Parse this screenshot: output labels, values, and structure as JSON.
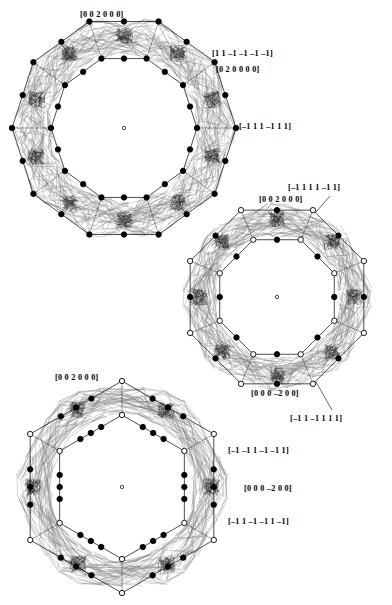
{
  "figure": {
    "type": "polytope-projection-diagram",
    "background_color": "#ffffff",
    "ink_color": "#000000",
    "panel_count": 3
  },
  "panels": [
    {
      "id": "panel-decagon",
      "shape": "decagon",
      "sides": 10,
      "center": [
        124,
        128
      ],
      "outer_radius": 112,
      "inner_radius": 73,
      "outer_marker": "filled",
      "inner_marker": "filled",
      "has_center_dot": true,
      "rotation_deg": 18,
      "labels": [
        {
          "name": "label-decagon-top",
          "text": "[0 0 2 0 0 0]",
          "x": 80,
          "y": 11,
          "anchor_vertex": [
            124,
            16
          ],
          "leader": false
        },
        {
          "name": "label-decagon-upper-right",
          "text": "[1 1 –1 –1 –1 –1]",
          "x": 212,
          "y": 50,
          "anchor_vertex": [
            213,
            66
          ],
          "leader": false
        },
        {
          "name": "label-decagon-right-upper",
          "text": "[0 2 0 0 0 0]",
          "x": 216,
          "y": 66,
          "anchor_vertex": [
            213,
            70
          ],
          "leader": false
        },
        {
          "name": "label-decagon-right",
          "text": "[–1 1 1 –1 1 1]",
          "x": 239,
          "y": 123,
          "anchor_vertex": [
            234,
            128
          ],
          "leader": false
        }
      ]
    },
    {
      "id": "panel-octagon",
      "shape": "octagon",
      "sides": 8,
      "center": [
        277,
        297
      ],
      "outer_radius": 94,
      "inner_radius": 62,
      "outer_marker": "mixed",
      "inner_marker": "mixed",
      "has_center_dot": true,
      "rotation_deg": 22.5,
      "labels": [
        {
          "name": "label-octagon-upper-right",
          "text": "[–1 1 1 1 –1 1]",
          "x": 288,
          "y": 184,
          "anchor_vertex": [
            312,
            214
          ],
          "leader": true,
          "leader_path": "M 330 196 L 316 212"
        },
        {
          "name": "label-octagon-top",
          "text": "[0 0 2 0 0 0]",
          "x": 259,
          "y": 196,
          "anchor_vertex": [
            277,
            209
          ],
          "leader": false
        },
        {
          "name": "label-octagon-bottom",
          "text": "[0 0 0 –2 0 0]",
          "x": 251,
          "y": 390,
          "anchor_vertex": [
            277,
            385
          ],
          "leader": false
        },
        {
          "name": "label-octagon-bottom-right",
          "text": "[–1 1 –1 1 1 1]",
          "x": 290,
          "y": 415,
          "anchor_vertex": [
            312,
            380
          ],
          "leader": true,
          "leader_path": "M 316 382 L 332 410"
        }
      ]
    },
    {
      "id": "panel-hexagon",
      "shape": "hexagon",
      "sides": 6,
      "center": [
        122,
        487
      ],
      "outer_radius": 106,
      "inner_radius": 72,
      "outer_marker": "mixed",
      "inner_marker": "mixed",
      "has_center_dot": true,
      "rotation_deg": 0,
      "labels": [
        {
          "name": "label-hexagon-top",
          "text": "[0 0 2 0 0 0]",
          "x": 55,
          "y": 374,
          "anchor_vertex": [
            69,
            388
          ],
          "leader": false
        },
        {
          "name": "label-hexagon-right-upper",
          "text": "[–1 –1 1 –1 –1 1]",
          "x": 228,
          "y": 447,
          "anchor_vertex": [
            224,
            452
          ],
          "leader": false
        },
        {
          "name": "label-hexagon-right-middle",
          "text": "[0 0 0 –2 0 0]",
          "x": 244,
          "y": 485,
          "anchor_vertex": [
            228,
            487
          ],
          "leader": false
        },
        {
          "name": "label-hexagon-right-lower",
          "text": "[–1 1 –1 –1 1 –1]",
          "x": 228,
          "y": 518,
          "anchor_vertex": [
            224,
            522
          ],
          "leader": false
        }
      ]
    }
  ],
  "all_label_texts": [
    "[0 0 2 0 0 0]",
    "[1 1 –1 –1 –1 –1]",
    "[0 2 0 0 0 0]",
    "[–1 1 1 –1 1 1]",
    "[–1 1 1 1 –1 1]",
    "[0 0 2 0 0 0]",
    "[0 0 0 –2 0 0]",
    "[–1 1 –1 1 1 1]",
    "[0 0 2 0 0 0]",
    "[–1 –1 1 –1 –1 1]",
    "[0 0 0 –2 0 0]",
    "[–1 1 –1 –1 1 –1]"
  ]
}
